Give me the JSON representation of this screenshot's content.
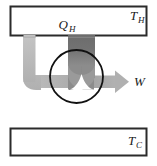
{
  "figure": {
    "type": "thermodynamic-heat-engine-diagram",
    "background_color": "#ffffff",
    "width": 157,
    "height": 166
  },
  "reservoirs": {
    "hot": {
      "label_main": "T",
      "label_sub": "H",
      "name": "hot-reservoir",
      "x": 10,
      "y": 6,
      "width": 137,
      "height": 30,
      "border_color": "#2b2b2b",
      "fill_color": "#ffffff"
    },
    "cold": {
      "label_main": "T",
      "label_sub": "C",
      "name": "cold-reservoir",
      "x": 10,
      "y": 128,
      "width": 137,
      "height": 28,
      "border_color": "#2b2b2b",
      "fill_color": "#ffffff"
    }
  },
  "flows": {
    "heat_in": {
      "label_main": "Q",
      "label_sub": "H",
      "name": "heat-input-band",
      "color": "#6e6e6e",
      "direction": "downward"
    },
    "work_out": {
      "label_main": "W",
      "label_sub": "",
      "name": "work-output-arrow",
      "color": "#a6a6a6",
      "direction": "rightward"
    },
    "return_flow": {
      "label_main": "",
      "label_sub": "",
      "name": "return-flow-arrow",
      "color": "#bcbcbc",
      "direction": "upward"
    }
  },
  "engine": {
    "name": "engine-circle",
    "cx": 76.5,
    "cy": 76.5,
    "r": 26.5,
    "stroke_color": "#111111",
    "fill_color": "none"
  }
}
